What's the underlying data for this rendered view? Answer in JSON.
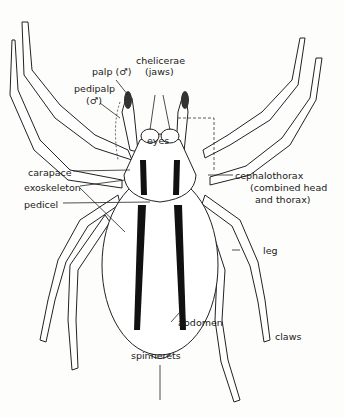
{
  "diagram": {
    "labels": {
      "palp": "palp (♂)",
      "chelicerae_1": "chelicerae",
      "chelicerae_2": "(jaws)",
      "pedipalp_1": "pedipalp",
      "pedipalp_2": "(♂)",
      "eyes": "eyes",
      "carapace": "carapace",
      "exoskeleton": "exoskeleton",
      "pedicel": "pedicel",
      "cephalothorax_1": "cephalothorax",
      "cephalothorax_2": "(combined head",
      "cephalothorax_3": "and thorax)",
      "leg": "leg",
      "abdomen": "abdomen",
      "claws": "claws",
      "spinnerets": "spinnerets"
    },
    "colors": {
      "ink": "#1a1a1a",
      "stripe": "#111111",
      "paper": "#fdfdfb"
    }
  }
}
